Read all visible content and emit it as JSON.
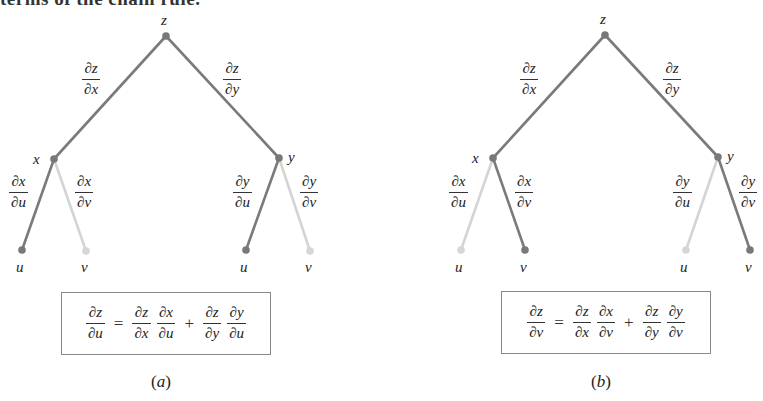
{
  "header_fragment": "terms of the chain rule.",
  "colors": {
    "active_edge": "#7a7a7a",
    "inactive_edge": "#d4d4d4",
    "active_node": "#787878",
    "inactive_node": "#d6d6d6",
    "box_border": "#888888"
  },
  "panels": [
    {
      "id": "a",
      "caption_letter": "a",
      "nodes": {
        "root": {
          "label": "z"
        },
        "left": {
          "label": "x"
        },
        "right": {
          "label": "y"
        },
        "left_left": {
          "label": "u",
          "active": true
        },
        "left_right": {
          "label": "v",
          "active": false
        },
        "right_left": {
          "label": "u",
          "active": true
        },
        "right_right": {
          "label": "v",
          "active": false
        }
      },
      "edge_labels": {
        "root_left": {
          "num": "∂z",
          "den": "∂x"
        },
        "root_right": {
          "num": "∂z",
          "den": "∂y"
        },
        "left_left": {
          "num": "∂x",
          "den": "∂u"
        },
        "left_right": {
          "num": "∂x",
          "den": "∂v"
        },
        "right_left": {
          "num": "∂y",
          "den": "∂u"
        },
        "right_right": {
          "num": "∂y",
          "den": "∂v"
        }
      },
      "equation": {
        "lhs": {
          "num": "∂z",
          "den": "∂u"
        },
        "equals": "=",
        "plus": "+",
        "term1": [
          {
            "num": "∂z",
            "den": "∂x"
          },
          {
            "num": "∂x",
            "den": "∂u"
          }
        ],
        "term2": [
          {
            "num": "∂z",
            "den": "∂y"
          },
          {
            "num": "∂y",
            "den": "∂u"
          }
        ]
      }
    },
    {
      "id": "b",
      "caption_letter": "b",
      "nodes": {
        "root": {
          "label": "z"
        },
        "left": {
          "label": "x"
        },
        "right": {
          "label": "y"
        },
        "left_left": {
          "label": "u",
          "active": false
        },
        "left_right": {
          "label": "v",
          "active": true
        },
        "right_left": {
          "label": "u",
          "active": false
        },
        "right_right": {
          "label": "v",
          "active": true
        }
      },
      "edge_labels": {
        "root_left": {
          "num": "∂z",
          "den": "∂x"
        },
        "root_right": {
          "num": "∂z",
          "den": "∂y"
        },
        "left_left": {
          "num": "∂x",
          "den": "∂u"
        },
        "left_right": {
          "num": "∂x",
          "den": "∂v"
        },
        "right_left": {
          "num": "∂y",
          "den": "∂u"
        },
        "right_right": {
          "num": "∂y",
          "den": "∂v"
        }
      },
      "equation": {
        "lhs": {
          "num": "∂z",
          "den": "∂v"
        },
        "equals": "=",
        "plus": "+",
        "term1": [
          {
            "num": "∂z",
            "den": "∂x"
          },
          {
            "num": "∂x",
            "den": "∂v"
          }
        ],
        "term2": [
          {
            "num": "∂z",
            "den": "∂y"
          },
          {
            "num": "∂y",
            "den": "∂v"
          }
        ]
      }
    }
  ]
}
